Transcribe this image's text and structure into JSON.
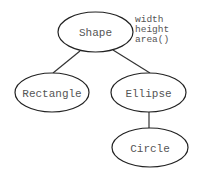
{
  "diagram": {
    "type": "class-hierarchy-tree",
    "nodes": [
      {
        "id": "shape",
        "label": "Shape"
      },
      {
        "id": "rectangle",
        "label": "Rectangle"
      },
      {
        "id": "ellipse",
        "label": "Ellipse"
      },
      {
        "id": "circle",
        "label": "Circle"
      }
    ],
    "edges": [
      {
        "from": "shape",
        "to": "rectangle"
      },
      {
        "from": "shape",
        "to": "ellipse"
      },
      {
        "from": "ellipse",
        "to": "circle"
      }
    ],
    "shape_attributes": [
      "width",
      "height",
      "area()"
    ]
  },
  "colors": {
    "stroke": "#222222",
    "text": "#555555",
    "background": "#ffffff"
  }
}
